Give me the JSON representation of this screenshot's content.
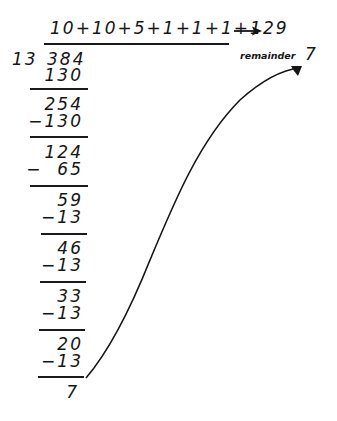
{
  "quotient": {
    "partials": "10+10+5+1+1+1+1",
    "arrow": "→",
    "total": "29"
  },
  "division": {
    "divisor": "13",
    "dividend": "384"
  },
  "steps": [
    {
      "value": "130",
      "kind": "subtract-unsigned"
    },
    {
      "value": "254",
      "kind": "difference"
    },
    {
      "value": "−130",
      "kind": "subtract"
    },
    {
      "value": "124",
      "kind": "difference"
    },
    {
      "value": "−  65",
      "kind": "subtract"
    },
    {
      "value": "59",
      "kind": "difference"
    },
    {
      "value": "−13",
      "kind": "subtract"
    },
    {
      "value": "46",
      "kind": "difference"
    },
    {
      "value": "−13",
      "kind": "subtract"
    },
    {
      "value": "33",
      "kind": "difference"
    },
    {
      "value": "−13",
      "kind": "subtract"
    },
    {
      "value": "20",
      "kind": "difference"
    },
    {
      "value": "−13",
      "kind": "subtract"
    },
    {
      "value": "7",
      "kind": "remainder"
    }
  ],
  "remainder": {
    "label": "remainder",
    "value": "7"
  },
  "colors": {
    "ink": "#151515",
    "background": "#ffffff"
  }
}
